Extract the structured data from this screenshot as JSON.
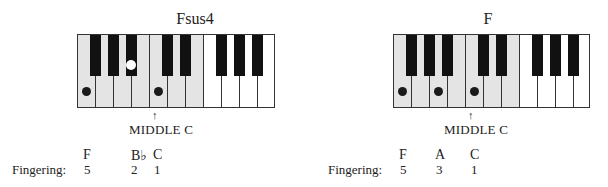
{
  "diagrams": [
    {
      "title": "Fsus4",
      "keyboard": {
        "white_keys": [
          "F",
          "G",
          "A",
          "B",
          "C",
          "D",
          "E",
          "F",
          "G",
          "A",
          "B"
        ],
        "shaded_white_keys": 7,
        "pressed_white": [
          "F",
          "C"
        ],
        "pressed_black": [
          "Bb"
        ]
      },
      "middle_c_arrow": "↑",
      "middle_c_label": "MIDDLE C",
      "notes": [
        "F",
        "B♭",
        "C"
      ],
      "fingering_label": "Fingering:",
      "fingering": [
        "5",
        "2",
        "1"
      ]
    },
    {
      "title": "F",
      "keyboard": {
        "white_keys": [
          "F",
          "G",
          "A",
          "B",
          "C",
          "D",
          "E",
          "F",
          "G",
          "A",
          "B"
        ],
        "shaded_white_keys": 7,
        "pressed_white": [
          "F",
          "A",
          "C"
        ],
        "pressed_black": []
      },
      "middle_c_arrow": "↑",
      "middle_c_label": "MIDDLE C",
      "notes": [
        "F",
        "A",
        "C"
      ],
      "fingering_label": "Fingering:",
      "fingering": [
        "5",
        "3",
        "1"
      ]
    }
  ]
}
